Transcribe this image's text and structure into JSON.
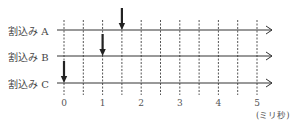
{
  "diagram": {
    "type": "interrupt timing diagram",
    "rows": [
      {
        "label": "割込み A",
        "interrupt_time_ms": 1.5
      },
      {
        "label": "割込み B",
        "interrupt_time_ms": 1.0
      },
      {
        "label": "割込み C",
        "interrupt_time_ms": 0.0
      }
    ],
    "x_axis": {
      "ticks": [
        "0",
        "1",
        "2",
        "3",
        "4",
        "5"
      ],
      "unit": "(ミリ秒)",
      "grid_step_ms": 0.5,
      "range_ms": [
        0,
        5
      ]
    },
    "colors": {
      "line": "#333333",
      "grid": "#555555",
      "arrow": "#222222"
    }
  }
}
